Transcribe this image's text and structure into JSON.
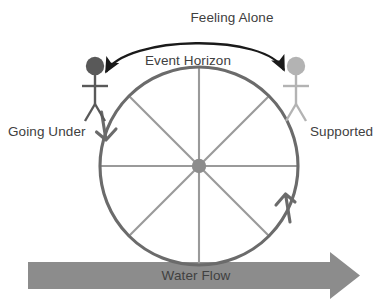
{
  "diagram": {
    "title_labels": {
      "feeling_alone": "Feeling Alone",
      "event_horizon": "Event Horizon",
      "going_under": "Going Under",
      "supported": "Supported",
      "water_flow": "Water Flow"
    },
    "colors": {
      "background": "#ffffff",
      "text": "#404040",
      "wheel_rim": "#666666",
      "wheel_spoke": "#9a9a9a",
      "wheel_hub": "#8c8c8c",
      "figure_left": "#595959",
      "figure_right": "#b3b3b3",
      "arc_arrow": "#1a1a1a",
      "water_flow_band": "#8c8c8c"
    },
    "geometry": {
      "wheel_center_x": 199,
      "wheel_center_y": 166,
      "wheel_radius": 99,
      "spoke_count": 8
    },
    "figures": [
      {
        "name": "going-under-figure",
        "side": "left",
        "head_x": 95,
        "head_y": 67,
        "shade": "dark"
      },
      {
        "name": "supported-figure",
        "side": "right",
        "head_x": 296,
        "head_y": 67,
        "shade": "light"
      }
    ],
    "rotation_arrows": [
      {
        "name": "left-descending-arrow",
        "direction": "down"
      },
      {
        "name": "right-ascending-arrow",
        "direction": "up"
      }
    ],
    "arc": {
      "name": "feeling-alone-arc",
      "double_headed": true
    }
  }
}
